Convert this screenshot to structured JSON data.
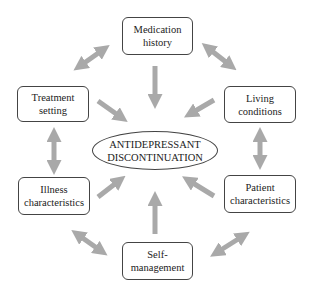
{
  "diagram": {
    "center": {
      "line1": "ANTIDEPRESSANT",
      "line2": "DISCONTINUATION"
    },
    "nodes": [
      {
        "id": "medication",
        "line1": "Medication",
        "line2": "history"
      },
      {
        "id": "living",
        "line1": "Living",
        "line2": "conditions"
      },
      {
        "id": "patient",
        "line1": "Patient",
        "line2": "characteristics"
      },
      {
        "id": "self",
        "line1": "Self-",
        "line2": "management"
      },
      {
        "id": "illness",
        "line1": "Illness",
        "line2": "characteristics"
      },
      {
        "id": "treatment",
        "line1": "Treatment",
        "line2": "setting"
      }
    ],
    "arrow_color": "#a9a9a9"
  }
}
